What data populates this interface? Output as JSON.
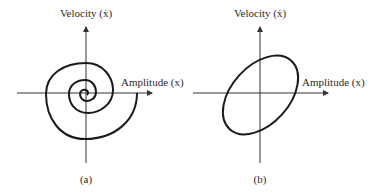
{
  "panels": [
    {
      "id": "a",
      "caption": "(a)",
      "y_label": "Velocity (ẋ)",
      "x_label": "Amplitude (x)",
      "curve": "spiral"
    },
    {
      "id": "b",
      "caption": "(b)",
      "y_label": "Velocity (ẋ)",
      "x_label": "Amplitude (x)",
      "curve": "ellipse"
    }
  ],
  "colors": {
    "curve": "#1a1a1a",
    "axis": "#333333"
  }
}
